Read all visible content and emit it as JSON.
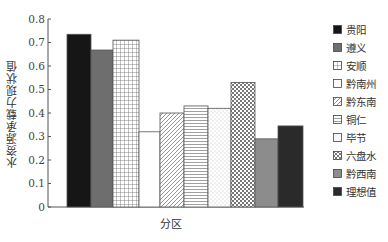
{
  "chart_data": {
    "type": "bar",
    "title": "",
    "xlabel": "分区",
    "ylabel": "水资源承载力现状值",
    "ylim": [
      0,
      0.8
    ],
    "yticks": [
      "0",
      "0.1",
      "0.2",
      "0.3",
      "0.4",
      "0.5",
      "0.6",
      "0.7",
      "0.8"
    ],
    "grid": false,
    "legend_position": "right",
    "categories": [
      "贵阳",
      "遵义",
      "安顺",
      "黔南州",
      "黔东南",
      "铜仁",
      "毕节",
      "六盘水",
      "黔西南",
      "理想值"
    ],
    "values": [
      0.735,
      0.668,
      0.71,
      0.32,
      0.4,
      0.43,
      0.42,
      0.53,
      0.29,
      0.345
    ],
    "patterns": [
      "solid-black",
      "solid-gray",
      "grid",
      "empty",
      "diagonal",
      "horizontal",
      "dots",
      "checker",
      "solid-lightgray",
      "solid-dark"
    ]
  },
  "legend": [
    {
      "label": "贵阳",
      "pattern": "solid-black"
    },
    {
      "label": "遵义",
      "pattern": "solid-gray"
    },
    {
      "label": "安顺",
      "pattern": "grid"
    },
    {
      "label": "黔南州",
      "pattern": "empty"
    },
    {
      "label": "黔东南",
      "pattern": "diagonal"
    },
    {
      "label": "铜仁",
      "pattern": "horizontal"
    },
    {
      "label": "毕节",
      "pattern": "dots"
    },
    {
      "label": "六盘水",
      "pattern": "checker"
    },
    {
      "label": "黔西南",
      "pattern": "solid-lightgray"
    },
    {
      "label": "理想值",
      "pattern": "solid-dark"
    }
  ],
  "colors": {
    "solid-black": "#161616",
    "solid-gray": "#6e6e6e",
    "solid-lightgray": "#8c8c8c",
    "solid-dark": "#2a2a2a",
    "axis": "#555555"
  }
}
